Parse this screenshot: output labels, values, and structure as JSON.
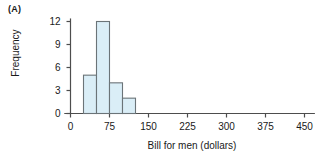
{
  "panel": {
    "label": "(A)"
  },
  "chart_data": {
    "type": "bar",
    "title": "",
    "subtitle": "",
    "xlabel": "Bill for men (dollars)",
    "ylabel": "Frequency",
    "xlim": [
      -12,
      480
    ],
    "ylim": [
      0,
      12.6
    ],
    "xticks": [
      0,
      75,
      150,
      225,
      300,
      375,
      450
    ],
    "xtick_labels": [
      "0",
      "75",
      "150",
      "225",
      "300",
      "375",
      "450"
    ],
    "yticks": [
      0,
      3,
      6,
      9,
      12
    ],
    "ytick_labels": [
      "0",
      "3",
      "6",
      "9",
      "12"
    ],
    "grid": false,
    "legend": null,
    "bin_width": 25,
    "bin_edges": [
      25,
      50,
      75,
      100,
      125
    ],
    "categories": [
      "25-50",
      "50-75",
      "75-100",
      "100-125"
    ],
    "values": [
      5,
      12,
      4,
      2
    ],
    "bar_fill_color": "#daeef7",
    "bar_edge_color": "#6b7478",
    "axis_color": "#4d4d4d"
  }
}
